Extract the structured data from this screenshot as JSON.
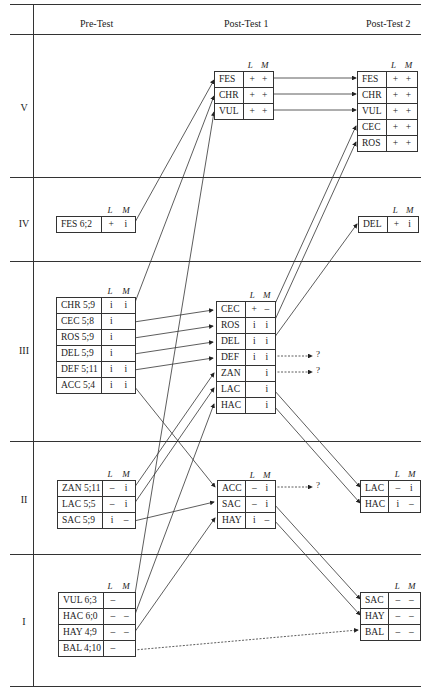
{
  "headers": {
    "pre": "Pre-Test",
    "post1": "Post-Test 1",
    "post2": "Post-Test 2"
  },
  "levels": [
    "V",
    "IV",
    "III",
    "II",
    "I"
  ],
  "lm": {
    "l": "L",
    "m": "M"
  },
  "unknown": "?",
  "pretest": {
    "IV": [
      {
        "name": "FES  6;2",
        "L": "+",
        "M": "i"
      }
    ],
    "III": [
      {
        "name": "CHR 5;9",
        "L": "i",
        "M": "i"
      },
      {
        "name": "CEC 5;8",
        "L": "i",
        "M": ""
      },
      {
        "name": "ROS  5;9",
        "L": "i",
        "M": ""
      },
      {
        "name": "DEL  5;9",
        "L": "i",
        "M": ""
      },
      {
        "name": "DEF  5;11",
        "L": "i",
        "M": "i"
      },
      {
        "name": "ACC 5;4",
        "L": "i",
        "M": "i"
      }
    ],
    "II": [
      {
        "name": "ZAN  5;11",
        "L": "–",
        "M": "i"
      },
      {
        "name": "LAC  5;5",
        "L": "–",
        "M": "i"
      },
      {
        "name": "SAC  5;9",
        "L": "i",
        "M": "–"
      }
    ],
    "I": [
      {
        "name": "VUL  6;3",
        "L": "–",
        "M": ""
      },
      {
        "name": "HAC  6;0",
        "L": "–",
        "M": "–"
      },
      {
        "name": "HAY  4;9",
        "L": "–",
        "M": "–"
      },
      {
        "name": "BAL  4;10",
        "L": "–",
        "M": ""
      }
    ]
  },
  "post1": {
    "V": [
      {
        "name": "FES",
        "L": "+",
        "M": "+"
      },
      {
        "name": "CHR",
        "L": "+",
        "M": "+"
      },
      {
        "name": "VUL",
        "L": "+",
        "M": "+"
      }
    ],
    "III": [
      {
        "name": "CEC",
        "L": "+",
        "M": "–"
      },
      {
        "name": "ROS",
        "L": "i",
        "M": "i"
      },
      {
        "name": "DEL",
        "L": "i",
        "M": "i"
      },
      {
        "name": "DEF",
        "L": "i",
        "M": "i"
      },
      {
        "name": "ZAN",
        "L": "",
        "M": "i"
      },
      {
        "name": "LAC",
        "L": "",
        "M": "i"
      },
      {
        "name": "HAC",
        "L": "",
        "M": "i"
      }
    ],
    "II": [
      {
        "name": "ACC",
        "L": "–",
        "M": "i"
      },
      {
        "name": "SAC",
        "L": "–",
        "M": "i"
      },
      {
        "name": "HAY",
        "L": "i",
        "M": "–"
      }
    ]
  },
  "post2": {
    "V": [
      {
        "name": "FES",
        "L": "+",
        "M": "+"
      },
      {
        "name": "CHR",
        "L": "+",
        "M": "+"
      },
      {
        "name": "VUL",
        "L": "+",
        "M": "+"
      },
      {
        "name": "CEC",
        "L": "+",
        "M": "+"
      },
      {
        "name": "ROS",
        "L": "+",
        "M": "+"
      }
    ],
    "IV": [
      {
        "name": "DEL",
        "L": "+",
        "M": "i"
      }
    ],
    "II": [
      {
        "name": "LAC",
        "L": "–",
        "M": "i"
      },
      {
        "name": "HAC",
        "L": "i",
        "M": "–"
      }
    ],
    "I": [
      {
        "name": "SAC",
        "L": "–",
        "M": "–"
      },
      {
        "name": "HAY",
        "L": "–",
        "M": "–"
      },
      {
        "name": "BAL",
        "L": "–",
        "M": "–"
      }
    ]
  }
}
